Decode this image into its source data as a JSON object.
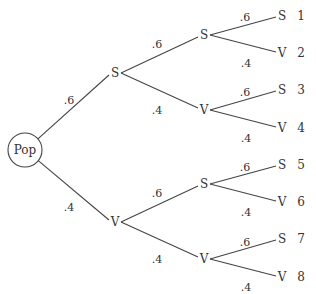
{
  "diagram": {
    "type": "probability-tree",
    "root": {
      "label": "Pop",
      "x": 25,
      "y": 150,
      "r": 17
    },
    "level1": [
      {
        "label": "S",
        "x": 115,
        "y": 73,
        "prob": ".6",
        "prob_x": 69,
        "prob_y": 100
      },
      {
        "label": "V",
        "x": 115,
        "y": 222,
        "prob": ".4",
        "prob_x": 69,
        "prob_y": 207
      }
    ],
    "level2": [
      {
        "parent": 0,
        "label": "S",
        "x": 204,
        "y": 35,
        "prob": ".6",
        "prob_x": 157,
        "prob_y": 44
      },
      {
        "parent": 0,
        "label": "V",
        "x": 204,
        "y": 110,
        "prob": ".4",
        "prob_x": 157,
        "prob_y": 110
      },
      {
        "parent": 1,
        "label": "S",
        "x": 204,
        "y": 184,
        "prob": ".6",
        "prob_x": 157,
        "prob_y": 193
      },
      {
        "parent": 1,
        "label": "V",
        "x": 204,
        "y": 259,
        "prob": ".4",
        "prob_x": 157,
        "prob_y": 259
      }
    ],
    "leaves": [
      {
        "parent": 0,
        "label": "S",
        "num": "1",
        "x": 282,
        "y": 16,
        "prob": ".6",
        "prob_x": 245,
        "prob_y": 17
      },
      {
        "parent": 0,
        "label": "V",
        "num": "2",
        "x": 282,
        "y": 53,
        "prob": ".4",
        "prob_x": 246,
        "prob_y": 63
      },
      {
        "parent": 1,
        "label": "S",
        "num": "3",
        "x": 282,
        "y": 90,
        "prob": ".6",
        "prob_x": 245,
        "prob_y": 92
      },
      {
        "parent": 1,
        "label": "V",
        "num": "4",
        "x": 282,
        "y": 128,
        "prob": ".4",
        "prob_x": 246,
        "prob_y": 138
      },
      {
        "parent": 2,
        "label": "S",
        "num": "5",
        "x": 282,
        "y": 165,
        "prob": ".6",
        "prob_x": 245,
        "prob_y": 167
      },
      {
        "parent": 2,
        "label": "V",
        "num": "6",
        "x": 282,
        "y": 202,
        "prob": ".4",
        "prob_x": 246,
        "prob_y": 212
      },
      {
        "parent": 3,
        "label": "S",
        "num": "7",
        "x": 282,
        "y": 239,
        "prob": ".6",
        "prob_x": 245,
        "prob_y": 242
      },
      {
        "parent": 3,
        "label": "V",
        "num": "8",
        "x": 282,
        "y": 277,
        "prob": ".4",
        "prob_x": 246,
        "prob_y": 287
      }
    ],
    "colors": {
      "line": "#444444",
      "text": "#333333",
      "background": "#ffffff"
    }
  }
}
